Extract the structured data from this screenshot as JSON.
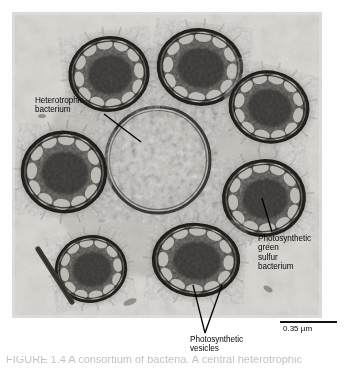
{
  "figure": {
    "type": "transmission-electron-micrograph",
    "caption_cropped": "FIGURE 1.4  A consortium of bacteria. A central heterotrophic"
  },
  "labels": {
    "heterotroph": "Heterotrophic\nbacterium",
    "green_sulfur": "Photosynthetic\ngreen\nsulfur\nbacterium",
    "vesicles": "Photosynthetic\nvesicles"
  },
  "scale": {
    "value": "0.35 µm",
    "bar_length_px": 57
  },
  "colors": {
    "label_text": "#0a0a0a",
    "leader_line": "#000000",
    "scale_bar": "#111111",
    "film_background": "#d8d6d1",
    "cell_dark": "#4a4743",
    "cell_membrane": "#2a2724",
    "vesicle_light": "#cbc8c2",
    "heterotroph_fill": "#c5c2bc"
  },
  "cells": {
    "photosynthetic_count": 7,
    "heterotrophic_count": 1,
    "description": "Seven electron-dense photosynthetic green sulfur bacteria, each with a peripheral ring of light photosynthetic vesicles (chlorosomes), arranged around one larger, electron-lucent granular heterotrophic bacterium"
  }
}
